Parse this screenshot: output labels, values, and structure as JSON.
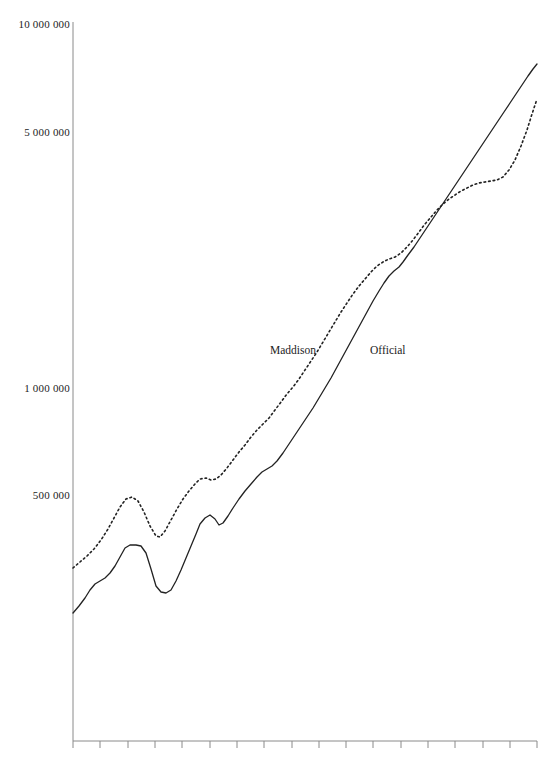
{
  "chart_data": {
    "type": "line",
    "title": "",
    "subtitle": "",
    "xlabel": "",
    "ylabel": "",
    "yscale": "log",
    "ylim": [
      100000,
      10000000
    ],
    "grid": false,
    "legend_position": "inline-annotation",
    "y_tick_labels": [
      "10 000 000",
      "5 000 000",
      "1 000 000",
      "500 000"
    ],
    "y_tick_values": [
      10000000,
      5000000,
      1000000,
      500000
    ],
    "x_tick_count": 18,
    "x_tick_labels": [],
    "annotations": [
      {
        "text": "Maddison",
        "x_px": 270,
        "y_px": 344
      },
      {
        "text": "Official",
        "x_px": 370,
        "y_px": 344
      }
    ],
    "series": [
      {
        "name": "Maddison",
        "style": "dotted",
        "color": "#222222",
        "points_px": [
          [
            73,
            568
          ],
          [
            80,
            562
          ],
          [
            87,
            556
          ],
          [
            94,
            549
          ],
          [
            101,
            540
          ],
          [
            108,
            529
          ],
          [
            114,
            518
          ],
          [
            120,
            507
          ],
          [
            126,
            499
          ],
          [
            132,
            497
          ],
          [
            138,
            501
          ],
          [
            144,
            512
          ],
          [
            150,
            526
          ],
          [
            156,
            536
          ],
          [
            160,
            537
          ],
          [
            165,
            531
          ],
          [
            171,
            520
          ],
          [
            177,
            509
          ],
          [
            183,
            499
          ],
          [
            189,
            491
          ],
          [
            195,
            484
          ],
          [
            200,
            479
          ],
          [
            206,
            478
          ],
          [
            211,
            480
          ],
          [
            216,
            479
          ],
          [
            221,
            475
          ],
          [
            227,
            468
          ],
          [
            233,
            460
          ],
          [
            239,
            452
          ],
          [
            245,
            445
          ],
          [
            251,
            437
          ],
          [
            257,
            430
          ],
          [
            263,
            424
          ],
          [
            269,
            418
          ],
          [
            275,
            410
          ],
          [
            281,
            402
          ],
          [
            287,
            394
          ],
          [
            293,
            387
          ],
          [
            299,
            379
          ],
          [
            305,
            370
          ],
          [
            311,
            361
          ],
          [
            317,
            352
          ],
          [
            323,
            342
          ],
          [
            329,
            332
          ],
          [
            335,
            322
          ],
          [
            341,
            312
          ],
          [
            347,
            303
          ],
          [
            353,
            294
          ],
          [
            359,
            286
          ],
          [
            365,
            279
          ],
          [
            371,
            272
          ],
          [
            377,
            266
          ],
          [
            383,
            262
          ],
          [
            389,
            259
          ],
          [
            395,
            257
          ],
          [
            401,
            253
          ],
          [
            407,
            247
          ],
          [
            413,
            240
          ],
          [
            419,
            232
          ],
          [
            425,
            224
          ],
          [
            431,
            217
          ],
          [
            437,
            210
          ],
          [
            443,
            204
          ],
          [
            449,
            199
          ],
          [
            455,
            195
          ],
          [
            461,
            191
          ],
          [
            467,
            188
          ],
          [
            473,
            185
          ],
          [
            479,
            183
          ],
          [
            485,
            182
          ],
          [
            491,
            181
          ],
          [
            497,
            180
          ],
          [
            503,
            177
          ],
          [
            509,
            170
          ],
          [
            515,
            160
          ],
          [
            521,
            146
          ],
          [
            527,
            130
          ],
          [
            532,
            114
          ],
          [
            537,
            99
          ]
        ]
      },
      {
        "name": "Official",
        "style": "solid",
        "color": "#222222",
        "points_px": [
          [
            73,
            613
          ],
          [
            79,
            606
          ],
          [
            85,
            598
          ],
          [
            90,
            590
          ],
          [
            95,
            584
          ],
          [
            100,
            581
          ],
          [
            105,
            578
          ],
          [
            110,
            573
          ],
          [
            115,
            566
          ],
          [
            120,
            557
          ],
          [
            125,
            548
          ],
          [
            130,
            545
          ],
          [
            136,
            545
          ],
          [
            141,
            546
          ],
          [
            146,
            553
          ],
          [
            151,
            569
          ],
          [
            156,
            586
          ],
          [
            161,
            592
          ],
          [
            166,
            593
          ],
          [
            171,
            590
          ],
          [
            176,
            581
          ],
          [
            181,
            570
          ],
          [
            186,
            558
          ],
          [
            191,
            546
          ],
          [
            196,
            534
          ],
          [
            200,
            524
          ],
          [
            205,
            518
          ],
          [
            210,
            515
          ],
          [
            215,
            519
          ],
          [
            219,
            525
          ],
          [
            223,
            523
          ],
          [
            228,
            516
          ],
          [
            233,
            508
          ],
          [
            239,
            499
          ],
          [
            245,
            491
          ],
          [
            251,
            484
          ],
          [
            257,
            477
          ],
          [
            262,
            472
          ],
          [
            267,
            469
          ],
          [
            272,
            466
          ],
          [
            277,
            461
          ],
          [
            283,
            453
          ],
          [
            289,
            444
          ],
          [
            295,
            435
          ],
          [
            301,
            426
          ],
          [
            307,
            417
          ],
          [
            313,
            408
          ],
          [
            319,
            398
          ],
          [
            325,
            388
          ],
          [
            331,
            378
          ],
          [
            337,
            367
          ],
          [
            343,
            356
          ],
          [
            349,
            345
          ],
          [
            355,
            334
          ],
          [
            361,
            323
          ],
          [
            367,
            312
          ],
          [
            373,
            301
          ],
          [
            379,
            291
          ],
          [
            384,
            283
          ],
          [
            389,
            276
          ],
          [
            394,
            271
          ],
          [
            399,
            267
          ],
          [
            403,
            262
          ],
          [
            408,
            255
          ],
          [
            414,
            247
          ],
          [
            420,
            238
          ],
          [
            426,
            229
          ],
          [
            432,
            220
          ],
          [
            438,
            211
          ],
          [
            444,
            202
          ],
          [
            450,
            193
          ],
          [
            456,
            184
          ],
          [
            462,
            175
          ],
          [
            468,
            166
          ],
          [
            474,
            157
          ],
          [
            480,
            148
          ],
          [
            486,
            139
          ],
          [
            492,
            130
          ],
          [
            498,
            121
          ],
          [
            504,
            112
          ],
          [
            510,
            103
          ],
          [
            516,
            94
          ],
          [
            522,
            85
          ],
          [
            528,
            76
          ],
          [
            533,
            69
          ],
          [
            537,
            64
          ]
        ]
      }
    ]
  },
  "axes": {
    "y_axis": {
      "x_px": 73,
      "top_px": 22,
      "bottom_px": 741
    },
    "x_axis": {
      "y_px": 741,
      "left_px": 73,
      "right_px": 537,
      "tick_length_px": 7,
      "tick_positions_px": [
        73,
        100,
        128,
        155,
        182,
        210,
        237,
        264,
        292,
        319,
        346,
        373,
        401,
        428,
        455,
        483,
        510,
        537
      ]
    },
    "y_labels": [
      {
        "text": "10 000 000",
        "y_px": 24
      },
      {
        "text": "5 000 000",
        "y_px": 132
      },
      {
        "text": "1 000 000",
        "y_px": 388
      },
      {
        "text": "500 000",
        "y_px": 495
      }
    ]
  },
  "colors": {
    "background": "#ffffff",
    "axis": "#8a8a8a",
    "line": "#222222",
    "text": "#1c1c1c"
  }
}
